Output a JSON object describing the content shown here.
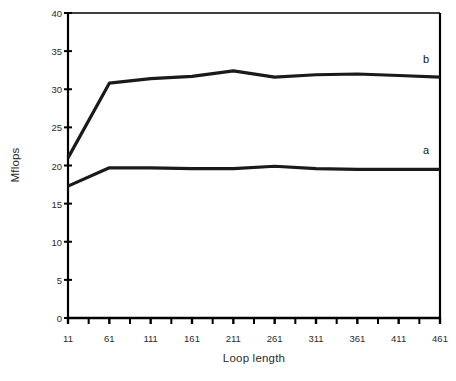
{
  "chart_data": {
    "type": "line",
    "title": "",
    "subtitle": "",
    "xlabel": "Loop length",
    "ylabel": "Mflops",
    "xlim": [
      11,
      461
    ],
    "ylim": [
      0,
      40
    ],
    "xticks": [
      11,
      61,
      111,
      161,
      211,
      261,
      311,
      361,
      411,
      461
    ],
    "xtick_labels": [
      "11",
      "61",
      "111",
      "161",
      "211",
      "261",
      "311",
      "361",
      "411",
      "461"
    ],
    "xminor_tick_step": 25,
    "yticks": [
      0,
      5,
      10,
      15,
      20,
      25,
      30,
      35,
      40
    ],
    "ytick_labels": [
      "0",
      "5",
      "10",
      "15",
      "20",
      "25",
      "30",
      "35",
      "40"
    ],
    "grid": false,
    "legend": "inline-end-labels",
    "legend_position": "right",
    "line_color": "#1a1a1a",
    "background_color": "#ffffff",
    "axis_color": "#000000",
    "x": [
      11,
      61,
      111,
      161,
      211,
      261,
      311,
      361,
      411,
      461
    ],
    "series": [
      {
        "name": "a",
        "label": "a",
        "color": "#1a1a1a",
        "line_width": 3.2,
        "values": [
          17.3,
          19.7,
          19.7,
          19.6,
          19.6,
          19.9,
          19.6,
          19.5,
          19.5,
          19.5
        ],
        "label_x": 461,
        "label_y": 22.0
      },
      {
        "name": "b",
        "label": "b",
        "color": "#1a1a1a",
        "line_width": 3.2,
        "values": [
          21.0,
          30.8,
          31.4,
          31.7,
          32.4,
          31.6,
          31.9,
          32.0,
          31.8,
          31.6
        ],
        "label_x": 461,
        "label_y": 34.0
      }
    ]
  }
}
